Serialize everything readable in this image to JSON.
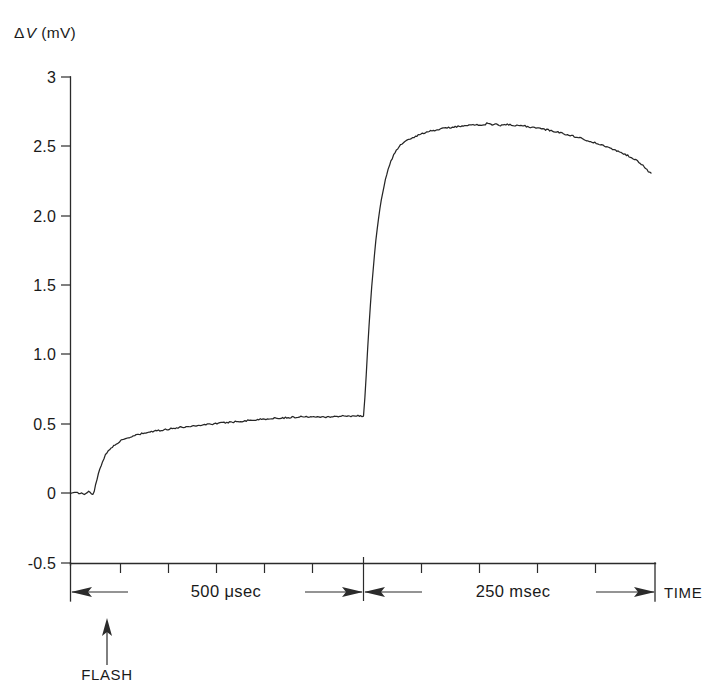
{
  "chart_data": {
    "type": "line",
    "title": "",
    "subtitle": "",
    "ylabel": "ΔV (mV)",
    "ylabel_delta": "Δ",
    "ylabel_symbol": "V",
    "ylabel_units": "(mV)",
    "xlabel": "TIME",
    "ylim": [
      -0.5,
      3.0
    ],
    "ytick_labels": [
      "3",
      "2.5",
      "2.0",
      "1.5",
      "1.0",
      "0.5",
      "0",
      "-0.5"
    ],
    "ytick_values": [
      3.0,
      2.5,
      2.0,
      1.5,
      1.0,
      0.5,
      0.0,
      -0.5
    ],
    "grid": false,
    "legend": "none",
    "x_axis_type": "broken-time-axis",
    "x_segments": [
      {
        "name": "fast-sweep",
        "span_label": "500 μsec",
        "span_value": 500,
        "span_units": "μsec",
        "n_ticks": 11
      },
      {
        "name": "slow-sweep",
        "span_label": "250 msec",
        "span_value": 250,
        "span_units": "msec",
        "n_ticks": 5
      }
    ],
    "annotations": [
      {
        "name": "flash-marker",
        "label": "FLASH",
        "arrow": "up",
        "x_norm": 0.062
      },
      {
        "name": "time-axis-label",
        "label": "TIME",
        "arrow": "right"
      },
      {
        "name": "axis-break",
        "label": "",
        "arrow": "double"
      }
    ],
    "series": [
      {
        "name": "fast-phase",
        "comment": "photoreceptor early receptor potential, microsecond sweep",
        "points": [
          [
            0.0,
            0.0
          ],
          [
            0.018,
            0.0
          ],
          [
            0.036,
            0.0
          ],
          [
            0.048,
            -0.01
          ],
          [
            0.056,
            0.0
          ],
          [
            0.062,
            0.01
          ],
          [
            0.068,
            0.0
          ],
          [
            0.074,
            -0.01
          ],
          [
            0.079,
            0.0
          ],
          [
            0.086,
            0.06
          ],
          [
            0.094,
            0.13
          ],
          [
            0.101,
            0.18
          ],
          [
            0.108,
            0.22
          ],
          [
            0.116,
            0.26
          ],
          [
            0.124,
            0.29
          ],
          [
            0.133,
            0.31
          ],
          [
            0.142,
            0.33
          ],
          [
            0.152,
            0.35
          ],
          [
            0.163,
            0.365
          ],
          [
            0.175,
            0.378
          ],
          [
            0.188,
            0.39
          ],
          [
            0.202,
            0.4
          ],
          [
            0.217,
            0.412
          ],
          [
            0.233,
            0.422
          ],
          [
            0.25,
            0.43
          ],
          [
            0.268,
            0.438
          ],
          [
            0.287,
            0.445
          ],
          [
            0.307,
            0.452
          ],
          [
            0.328,
            0.459
          ],
          [
            0.35,
            0.466
          ],
          [
            0.373,
            0.472
          ],
          [
            0.397,
            0.478
          ],
          [
            0.422,
            0.484
          ],
          [
            0.448,
            0.49
          ],
          [
            0.475,
            0.496
          ],
          [
            0.503,
            0.502
          ],
          [
            0.532,
            0.508
          ],
          [
            0.562,
            0.514
          ],
          [
            0.593,
            0.52
          ],
          [
            0.625,
            0.526
          ],
          [
            0.658,
            0.532
          ],
          [
            0.692,
            0.537
          ],
          [
            0.727,
            0.542
          ],
          [
            0.763,
            0.546
          ],
          [
            0.8,
            0.55
          ],
          [
            0.84,
            0.552
          ],
          [
            0.88,
            0.548
          ],
          [
            0.92,
            0.553
          ],
          [
            0.96,
            0.556
          ],
          [
            1.0,
            0.555
          ]
        ]
      },
      {
        "name": "slow-phase",
        "comment": "late receptor potential, millisecond sweep after axis break",
        "points": [
          [
            0.0,
            0.555
          ],
          [
            0.006,
            0.72
          ],
          [
            0.012,
            0.95
          ],
          [
            0.019,
            1.2
          ],
          [
            0.026,
            1.42
          ],
          [
            0.034,
            1.62
          ],
          [
            0.042,
            1.8
          ],
          [
            0.051,
            1.96
          ],
          [
            0.061,
            2.1
          ],
          [
            0.072,
            2.22
          ],
          [
            0.084,
            2.32
          ],
          [
            0.097,
            2.4
          ],
          [
            0.111,
            2.46
          ],
          [
            0.127,
            2.505
          ],
          [
            0.145,
            2.53
          ],
          [
            0.165,
            2.555
          ],
          [
            0.187,
            2.575
          ],
          [
            0.211,
            2.595
          ],
          [
            0.237,
            2.61
          ],
          [
            0.265,
            2.622
          ],
          [
            0.295,
            2.632
          ],
          [
            0.327,
            2.64
          ],
          [
            0.36,
            2.645
          ],
          [
            0.394,
            2.655
          ],
          [
            0.417,
            2.648
          ],
          [
            0.43,
            2.665
          ],
          [
            0.445,
            2.652
          ],
          [
            0.46,
            2.658
          ],
          [
            0.478,
            2.648
          ],
          [
            0.5,
            2.655
          ],
          [
            0.525,
            2.645
          ],
          [
            0.552,
            2.648
          ],
          [
            0.58,
            2.636
          ],
          [
            0.61,
            2.628
          ],
          [
            0.642,
            2.615
          ],
          [
            0.676,
            2.6
          ],
          [
            0.71,
            2.582
          ],
          [
            0.745,
            2.562
          ],
          [
            0.78,
            2.54
          ],
          [
            0.812,
            2.518
          ],
          [
            0.843,
            2.495
          ],
          [
            0.872,
            2.472
          ],
          [
            0.9,
            2.45
          ],
          [
            0.925,
            2.425
          ],
          [
            0.948,
            2.4
          ],
          [
            0.966,
            2.37
          ],
          [
            0.98,
            2.345
          ],
          [
            0.99,
            2.32
          ],
          [
            1.0,
            2.305
          ]
        ]
      }
    ]
  }
}
